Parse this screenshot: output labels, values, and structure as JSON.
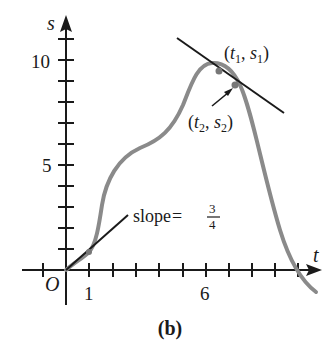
{
  "figure": {
    "caption": "(b)",
    "axes": {
      "x_label": "t",
      "y_label": "s",
      "origin_label": "O",
      "x_tick_labels": [
        {
          "value": 1,
          "text": "1"
        },
        {
          "value": 6,
          "text": "6"
        }
      ],
      "y_tick_labels": [
        {
          "value": 5,
          "text": "5"
        },
        {
          "value": 10,
          "text": "10"
        }
      ],
      "x_ticks": [
        -1,
        1,
        2,
        3,
        4,
        5,
        6,
        7,
        8,
        9,
        10
      ],
      "y_ticks": [
        1,
        2,
        3,
        4,
        5,
        6,
        7,
        8,
        9,
        10,
        11
      ]
    },
    "annotations": {
      "slope_text": "slope",
      "slope_eq": "=",
      "slope_num": "3",
      "slope_den": "4",
      "point1": {
        "open": "(",
        "t": "t",
        "t_sub": "1",
        "comma": ", ",
        "s": "s",
        "s_sub": "1",
        "close": ")"
      },
      "point2": {
        "open": "(",
        "t": "t",
        "t_sub": "2",
        "comma": ", ",
        "s": "s",
        "s_sub": "2",
        "close": ")"
      }
    },
    "colors": {
      "curve": "#8a8a8a",
      "axes": "#1a1a1a",
      "tangent": "#1a1a1a"
    }
  }
}
